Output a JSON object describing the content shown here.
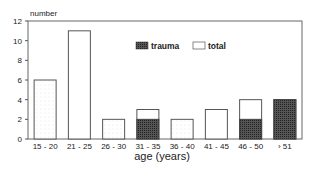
{
  "chart_data": {
    "type": "bar",
    "title": "",
    "xlabel": "age (years)",
    "ylabel": "number",
    "ylim": [
      0,
      12
    ],
    "yticks": [
      0,
      2,
      4,
      6,
      8,
      10,
      12
    ],
    "grid": false,
    "legend_position": "top-center inside plot",
    "categories": [
      "15 - 20",
      "21 - 25",
      "26 - 30",
      "31 - 35",
      "36 - 40",
      "41 - 45",
      "46 - 50",
      "› 51"
    ],
    "series": [
      {
        "name": "trauma",
        "values": [
          0,
          0,
          0,
          2,
          0,
          0,
          2,
          4
        ],
        "pattern": "dark crosshatch"
      },
      {
        "name": "total",
        "values": [
          6,
          11,
          2,
          3,
          2,
          3,
          4,
          4
        ],
        "pattern": "light dotted"
      }
    ]
  },
  "legend": {
    "trauma": "trauma",
    "total": "total"
  },
  "colors": {
    "trauma": "#3a3a3a",
    "total": "#ffffff",
    "axis": "#555555"
  }
}
